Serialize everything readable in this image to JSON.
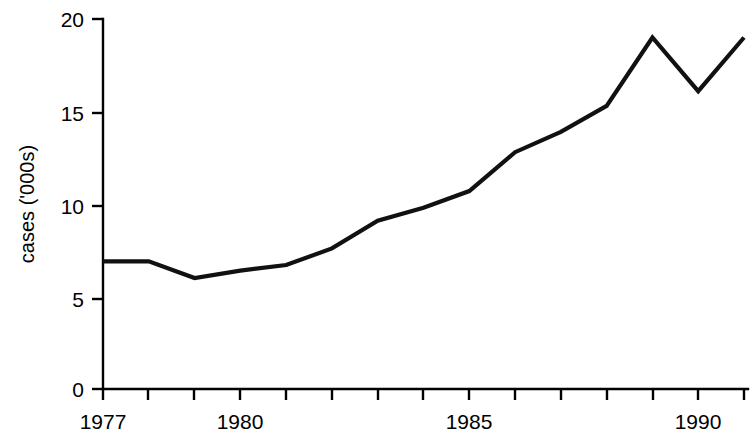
{
  "chart_data": {
    "type": "line",
    "title": "",
    "subtitle": "",
    "xlabel": "",
    "ylabel": "cases ('000s)",
    "x": [
      1977,
      1978,
      1979,
      1980,
      1981,
      1982,
      1983,
      1984,
      1985,
      1986,
      1987,
      1988,
      1989,
      1990,
      1991
    ],
    "values": [
      6.9,
      6.9,
      6.0,
      6.4,
      6.7,
      7.6,
      9.1,
      9.8,
      10.7,
      12.8,
      13.9,
      15.3,
      19.0,
      16.1,
      19.0
    ],
    "series": [
      {
        "name": "cases",
        "values": [
          6.9,
          6.9,
          6.0,
          6.4,
          6.7,
          7.6,
          9.1,
          9.8,
          10.7,
          12.8,
          13.9,
          15.3,
          19.0,
          16.1,
          19.0
        ]
      }
    ],
    "xlim": [
      1977,
      1991
    ],
    "ylim": [
      0,
      20
    ],
    "grid": false,
    "legend": false,
    "legend_position": "none",
    "line_color": "#111111",
    "y_ticks": [
      0,
      5,
      10,
      15,
      20
    ],
    "y_tick_labels": [
      "0",
      "5",
      "10",
      "15",
      "20"
    ],
    "x_ticks": [
      1977,
      1978,
      1979,
      1980,
      1981,
      1982,
      1983,
      1984,
      1985,
      1986,
      1987,
      1988,
      1989,
      1990,
      1991
    ],
    "x_tick_labels_shown": [
      "1977",
      "1980",
      "1985",
      "1990"
    ],
    "x_tick_labels_shown_values": [
      1977,
      1980,
      1985,
      1990
    ],
    "annotations": []
  },
  "axes": {
    "y_axis_title": "cases ('000s)",
    "y_tick_0": "0",
    "y_tick_5": "5",
    "y_tick_10": "10",
    "y_tick_15": "15",
    "y_tick_20": "20",
    "x_tick_1977": "1977",
    "x_tick_1980": "1980",
    "x_tick_1985": "1985",
    "x_tick_1990": "1990"
  }
}
